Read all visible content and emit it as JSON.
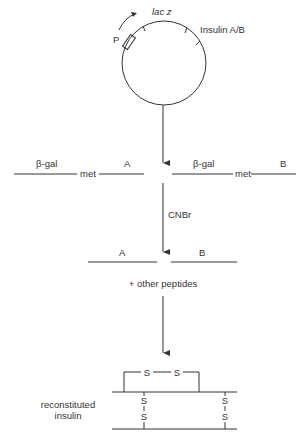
{
  "plasmid": {
    "promoter_label": "P",
    "gene_label": "lac z",
    "insert_label": "Insulin A/B"
  },
  "fusion_proteins": {
    "left": {
      "carrier": "β-gal",
      "linker": "met",
      "chain": "A"
    },
    "right": {
      "carrier": "β-gal",
      "linker": "met",
      "chain": "B"
    }
  },
  "cleavage": {
    "reagent": "CNBr",
    "product_left": "A",
    "product_right": "B",
    "byproducts": "+ other peptides"
  },
  "result": {
    "label_line1": "reconstituted",
    "label_line2": "insulin",
    "disulfide_atom": "S"
  }
}
